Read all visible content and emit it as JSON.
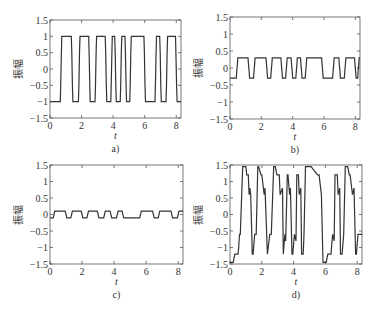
{
  "chart_data": [
    {
      "id": "a",
      "type": "line",
      "panel_label": "a)",
      "xlabel": "t",
      "ylabel": "振幅",
      "xlim": [
        0,
        8.3
      ],
      "ylim": [
        -1.5,
        1.5
      ],
      "xticks": [
        0,
        2,
        4,
        6,
        8
      ],
      "yticks": [
        1.5,
        1,
        0.5,
        0,
        -0.5,
        -1,
        -1.5
      ],
      "ytick_labels": [
        "1.5",
        "1",
        "0.5",
        "0",
        "−0.5",
        "−1",
        "−1.5"
      ],
      "grid": false,
      "amplitude": 1,
      "description": "Square wave switching between -1 and 1 with short intermediate steps at ±0.5",
      "x": [
        0,
        0.65,
        0.68,
        0.72,
        0.75,
        1.35,
        1.38,
        1.42,
        1.45,
        1.8,
        1.83,
        1.87,
        1.9,
        2.45,
        2.48,
        2.52,
        2.55,
        2.85,
        2.88,
        2.92,
        2.95,
        3.5,
        3.53,
        3.57,
        3.6,
        3.85,
        3.88,
        3.92,
        3.95,
        4.1,
        4.13,
        4.17,
        4.2,
        4.45,
        4.48,
        4.52,
        4.55,
        4.75,
        4.78,
        4.82,
        4.85,
        5.05,
        5.08,
        5.12,
        5.15,
        5.95,
        5.98,
        6.02,
        6.05,
        6.65,
        6.68,
        6.72,
        6.75,
        6.95,
        6.98,
        7.02,
        7.05,
        7.35,
        7.38,
        7.42,
        7.45,
        7.95,
        7.98,
        8.02,
        8.05,
        8.3
      ],
      "y": [
        -1,
        -1,
        -0.5,
        0.5,
        1,
        1,
        0.5,
        -0.5,
        -1,
        -1,
        -0.5,
        0.5,
        1,
        1,
        0.5,
        -0.5,
        -1,
        -1,
        -0.5,
        0.5,
        1,
        1,
        0.5,
        -0.5,
        -1,
        -1,
        -0.5,
        0.5,
        1,
        1,
        0.5,
        -0.5,
        -1,
        -1,
        -0.5,
        0.5,
        1,
        1,
        0.5,
        -0.5,
        -1,
        -1,
        -0.5,
        0.5,
        1,
        1,
        0.5,
        -0.5,
        -1,
        -1,
        -0.5,
        0.5,
        1,
        1,
        0.5,
        -0.5,
        -1,
        -1,
        -0.5,
        0.5,
        1,
        1,
        0.5,
        -0.5,
        -1,
        -1
      ]
    },
    {
      "id": "b",
      "type": "line",
      "panel_label": "b)",
      "xlabel": "t",
      "ylabel": "振幅",
      "xlim": [
        0,
        8.3
      ],
      "ylim": [
        -1.5,
        1.5
      ],
      "xticks": [
        0,
        2,
        4,
        6,
        8
      ],
      "yticks": [
        1.5,
        1,
        0.5,
        0,
        -0.5,
        -1,
        -1.5
      ],
      "ytick_labels": [
        "1.5",
        "1",
        "0.5",
        "0",
        "−0.5",
        "−1",
        "−1.5"
      ],
      "grid": false,
      "amplitude": 0.3,
      "description": "Square wave switching between -0.3 and 0.3 with short intermediate steps at ±0.1",
      "x": [
        0,
        0.4,
        0.43,
        0.47,
        0.5,
        1.15,
        1.18,
        1.22,
        1.25,
        1.5,
        1.53,
        1.57,
        1.6,
        2.3,
        2.33,
        2.37,
        2.4,
        2.6,
        2.63,
        2.67,
        2.7,
        3.25,
        3.28,
        3.32,
        3.35,
        3.55,
        3.58,
        3.62,
        3.65,
        3.9,
        3.93,
        3.97,
        4.0,
        4.2,
        4.23,
        4.27,
        4.3,
        4.5,
        4.53,
        4.57,
        4.6,
        4.8,
        4.83,
        4.87,
        4.9,
        5.85,
        5.88,
        5.92,
        5.95,
        6.55,
        6.58,
        6.62,
        6.65,
        6.95,
        6.98,
        7.02,
        7.05,
        7.3,
        7.33,
        7.37,
        7.4,
        7.95,
        7.98,
        8.02,
        8.05,
        8.15,
        8.18,
        8.22,
        8.25,
        8.3
      ],
      "y": [
        -0.3,
        -0.3,
        -0.1,
        0.1,
        0.3,
        0.3,
        0.1,
        -0.1,
        -0.3,
        -0.3,
        -0.1,
        0.1,
        0.3,
        0.3,
        0.1,
        -0.1,
        -0.3,
        -0.3,
        -0.1,
        0.1,
        0.3,
        0.3,
        0.1,
        -0.1,
        -0.3,
        -0.3,
        -0.1,
        0.1,
        0.3,
        0.3,
        0.1,
        -0.1,
        -0.3,
        -0.3,
        -0.1,
        0.1,
        0.3,
        0.3,
        0.1,
        -0.1,
        -0.3,
        -0.3,
        -0.1,
        0.1,
        0.3,
        0.3,
        0.1,
        -0.1,
        -0.3,
        -0.3,
        -0.1,
        0.1,
        0.3,
        0.3,
        0.1,
        -0.1,
        -0.3,
        -0.3,
        -0.1,
        0.1,
        0.3,
        0.3,
        0.1,
        -0.1,
        -0.3,
        -0.3,
        -0.1,
        0.1,
        0.3,
        0.3
      ]
    },
    {
      "id": "c",
      "type": "line",
      "panel_label": "c)",
      "xlabel": "t",
      "ylabel": "振幅",
      "xlim": [
        0,
        8.3
      ],
      "ylim": [
        -1.5,
        1.5
      ],
      "xticks": [
        0,
        2,
        4,
        6,
        8
      ],
      "yticks": [
        1.5,
        1,
        0.5,
        0,
        -0.5,
        -1,
        -1.5
      ],
      "ytick_labels": [
        "1.5",
        "1",
        "0.5",
        "0",
        "−0.5",
        "−1",
        "−1.5"
      ],
      "grid": false,
      "amplitude": 0.1,
      "description": "Small square wave switching between -0.1 and 0.1",
      "x": [
        0,
        0.2,
        0.3,
        0.95,
        1.05,
        1.3,
        1.4,
        1.95,
        2.05,
        2.3,
        2.4,
        2.95,
        3.05,
        3.35,
        3.45,
        3.75,
        3.85,
        4.15,
        4.25,
        4.5,
        4.6,
        5.6,
        5.7,
        6.4,
        6.5,
        6.75,
        6.85,
        7.55,
        7.65,
        7.95,
        8.05,
        8.3
      ],
      "y": [
        -0.1,
        -0.1,
        0.1,
        0.1,
        -0.1,
        -0.1,
        0.1,
        0.1,
        -0.1,
        -0.1,
        0.1,
        0.1,
        -0.1,
        -0.1,
        0.1,
        0.1,
        -0.1,
        -0.1,
        0.1,
        0.1,
        -0.1,
        -0.1,
        0.1,
        0.1,
        -0.1,
        -0.1,
        0.1,
        0.1,
        -0.1,
        -0.1,
        0.1,
        0.1
      ]
    },
    {
      "id": "d",
      "type": "line",
      "panel_label": "d)",
      "xlabel": "t",
      "ylabel": "振幅",
      "xlim": [
        0,
        8.3
      ],
      "ylim": [
        -1.5,
        1.5
      ],
      "xticks": [
        0,
        2,
        4,
        6,
        8
      ],
      "yticks": [
        1.5,
        1,
        0.5,
        0,
        -0.5,
        -1,
        -1.5
      ],
      "ytick_labels": [
        "1.5",
        "1",
        "0.5",
        "0",
        "−0.5",
        "−1",
        "−1.5"
      ],
      "grid": false,
      "amplitude": 1.45,
      "description": "Distorted switching waveform peaking near ±1.45 with decaying plateaus and spikes",
      "x": [
        0,
        0.2,
        0.3,
        0.5,
        0.55,
        0.6,
        0.65,
        0.8,
        0.85,
        1.0,
        1.05,
        1.15,
        1.2,
        1.25,
        1.3,
        1.4,
        1.45,
        1.55,
        1.65,
        1.75,
        1.8,
        1.95,
        2.0,
        2.15,
        2.2,
        2.35,
        2.5,
        2.6,
        2.75,
        2.85,
        2.95,
        3.1,
        3.15,
        3.3,
        3.35,
        3.45,
        3.5,
        3.6,
        3.65,
        3.75,
        3.8,
        3.9,
        3.95,
        4.05,
        4.15,
        4.2,
        4.3,
        4.35,
        4.45,
        4.5,
        4.6,
        4.65,
        4.75,
        4.8,
        4.9,
        5.05,
        5.1,
        5.5,
        5.6,
        5.75,
        5.85,
        6.05,
        6.15,
        6.35,
        6.45,
        6.55,
        6.6,
        6.75,
        6.8,
        6.9,
        6.95,
        7.05,
        7.15,
        7.25,
        7.4,
        7.5,
        7.55,
        7.7,
        7.8,
        7.9,
        7.95,
        8.05,
        8.15,
        8.25,
        8.3
      ],
      "y": [
        -1.45,
        -1.45,
        -1.2,
        -1.2,
        -1.0,
        -0.6,
        -0.6,
        1.45,
        1.45,
        1.45,
        1.2,
        1.2,
        0.6,
        0.8,
        0.6,
        -1.2,
        -1.2,
        -0.6,
        -0.6,
        1.45,
        1.45,
        1.2,
        1.2,
        0.6,
        0.8,
        -1.2,
        -0.6,
        -0.6,
        1.45,
        1.45,
        1.2,
        1.2,
        0.6,
        0.8,
        -1.2,
        -0.6,
        -0.8,
        1.2,
        1.2,
        0.6,
        0.8,
        -1.2,
        -1.2,
        -0.6,
        -0.8,
        1.2,
        1.2,
        0.6,
        0.8,
        -1.2,
        -1.2,
        -0.6,
        1.45,
        1.45,
        1.45,
        1.45,
        1.45,
        1.2,
        1.2,
        0.6,
        -1.45,
        -1.45,
        -1.2,
        -1.2,
        -0.6,
        -0.8,
        1.2,
        1.2,
        0.6,
        0.8,
        -1.2,
        -1.2,
        -0.6,
        1.45,
        1.45,
        1.2,
        1.2,
        0.6,
        0.8,
        -1.2,
        -1.2,
        -0.6,
        -0.6,
        -0.6,
        -0.6
      ]
    }
  ],
  "layout": {
    "panels": [
      {
        "id": "a",
        "left": 50,
        "top": 20,
        "right": 181,
        "bottom": 118
      },
      {
        "id": "b",
        "left": 230,
        "top": 17,
        "right": 360,
        "bottom": 119
      },
      {
        "id": "c",
        "left": 50,
        "top": 165,
        "right": 183,
        "bottom": 264
      },
      {
        "id": "d",
        "left": 230,
        "top": 165,
        "right": 362,
        "bottom": 264
      }
    ]
  },
  "colors": {
    "line": "#333333",
    "axis": "#555555",
    "text": "#333333"
  }
}
